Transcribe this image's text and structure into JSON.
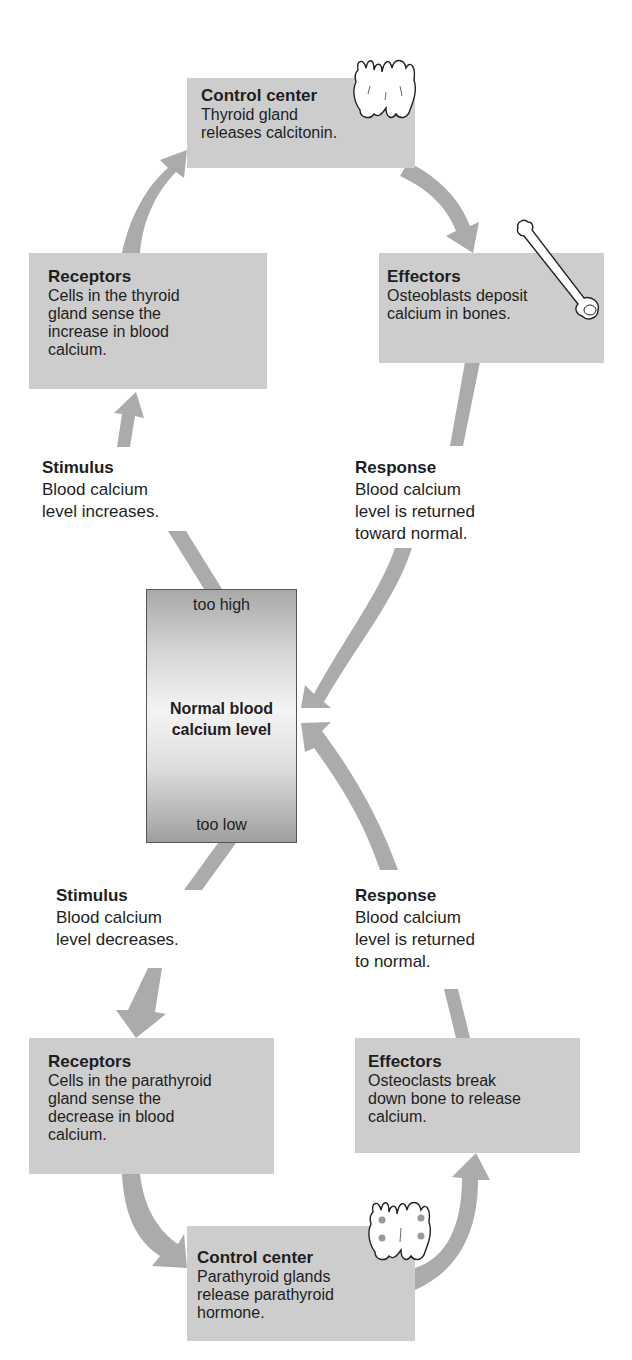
{
  "diagram": {
    "colors": {
      "box_fill": "#cdcdcd",
      "arrow_fill": "#ababab",
      "text": "#1e1e1e",
      "gland_dot": "#9a9a9a"
    },
    "high_loop": {
      "control_center": {
        "title": "Control center",
        "body": "Thyroid gland\nreleases calcitonin.",
        "icon": "thyroid-gland-icon"
      },
      "receptors": {
        "title": "Receptors",
        "body": "Cells in the thyroid\ngland sense the\nincrease in blood\ncalcium."
      },
      "effectors": {
        "title": "Effectors",
        "body": "Osteoblasts deposit\ncalcium in bones.",
        "icon": "bone-icon"
      },
      "stimulus": {
        "title": "Stimulus",
        "body": "Blood calcium\nlevel increases."
      },
      "response": {
        "title": "Response",
        "body": "Blood calcium\nlevel is returned\ntoward normal."
      }
    },
    "setpoint": {
      "top_label": "too high",
      "center_label": "Normal blood\ncalcium level",
      "bottom_label": "too low"
    },
    "low_loop": {
      "stimulus": {
        "title": "Stimulus",
        "body": "Blood calcium\nlevel decreases."
      },
      "response": {
        "title": "Response",
        "body": "Blood calcium\nlevel is returned\nto normal."
      },
      "receptors": {
        "title": "Receptors",
        "body": "Cells in the parathyroid\ngland sense the\ndecrease in blood\ncalcium."
      },
      "effectors": {
        "title": "Effectors",
        "body": "Osteoclasts break\ndown bone to release\ncalcium."
      },
      "control_center": {
        "title": "Control center",
        "body": "Parathyroid glands\nrelease parathyroid\nhormone.",
        "icon": "parathyroid-glands-icon"
      }
    }
  }
}
